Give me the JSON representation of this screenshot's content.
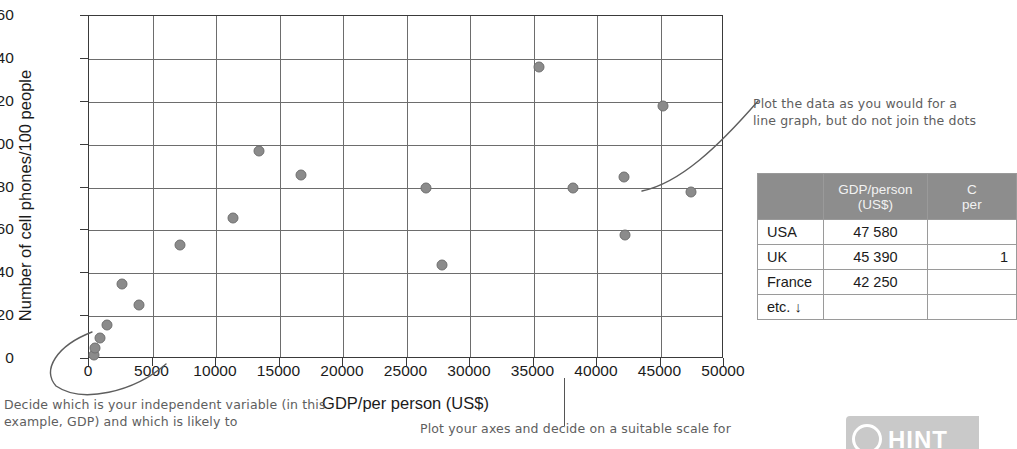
{
  "chart_data": {
    "type": "scatter",
    "title": "",
    "xlabel": "GDP/per person (US$)",
    "ylabel": "Number of cell phones/100 people",
    "xlim": [
      0,
      50000
    ],
    "ylim": [
      0,
      160
    ],
    "xticks": [
      "0",
      "5000",
      "10000",
      "15000",
      "20000",
      "25000",
      "30000",
      "35000",
      "40000",
      "45000",
      "50000"
    ],
    "yticks": [
      "0",
      "20",
      "40",
      "60",
      "80",
      "100",
      "120",
      "140",
      "160"
    ],
    "grid": true,
    "legend": "none",
    "points": [
      {
        "x": 400,
        "y": 2
      },
      {
        "x": 500,
        "y": 5
      },
      {
        "x": 900,
        "y": 10
      },
      {
        "x": 1400,
        "y": 16
      },
      {
        "x": 2600,
        "y": 35
      },
      {
        "x": 3900,
        "y": 25
      },
      {
        "x": 7200,
        "y": 53
      },
      {
        "x": 11300,
        "y": 66
      },
      {
        "x": 13400,
        "y": 97
      },
      {
        "x": 16700,
        "y": 86
      },
      {
        "x": 26500,
        "y": 80
      },
      {
        "x": 27800,
        "y": 44
      },
      {
        "x": 35400,
        "y": 136
      },
      {
        "x": 38100,
        "y": 80
      },
      {
        "x": 42100,
        "y": 85
      },
      {
        "x": 42200,
        "y": 58
      },
      {
        "x": 45200,
        "y": 118
      },
      {
        "x": 47400,
        "y": 78
      }
    ]
  },
  "annotations": {
    "right": "Plot the data as you would for a line graph, but do not join the dots",
    "bottom_left": "Decide which is your independent variable (in this example, GDP) and which is likely to",
    "bottom_center": "Plot your axes and decide on a suitable scale for"
  },
  "table": {
    "headers": [
      "",
      "GDP/person (US$)",
      "C… per…"
    ],
    "rows": [
      {
        "label": "USA",
        "gdp": "47 580",
        "extra": ""
      },
      {
        "label": "UK",
        "gdp": "45 390",
        "extra": "1"
      },
      {
        "label": "France",
        "gdp": "42 250",
        "extra": ""
      },
      {
        "label": "etc. ↓",
        "gdp": "",
        "extra": ""
      }
    ]
  },
  "hint_badge": {
    "label": "HINT"
  },
  "colors": {
    "dot": "#8b8b8b",
    "grid": "#6d6d6d",
    "axis": "#3a3a3a",
    "table_header_bg": "#8d8d8d",
    "hand_ink": "#5e5e5e",
    "hint_bg": "#c9c9c9"
  }
}
